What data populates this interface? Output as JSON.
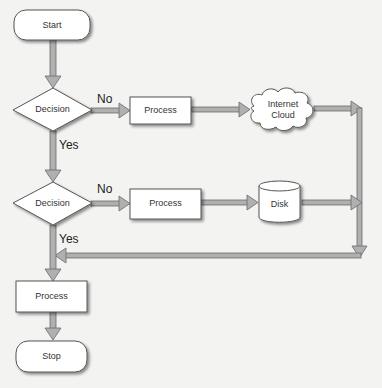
{
  "diagram": {
    "type": "flowchart",
    "colors": {
      "background": "#f3f3f1",
      "node_fill": "#ffffff",
      "node_stroke": "#555555",
      "arrow_fill": "#a8a8a8",
      "arrow_stroke": "#6e6e6e",
      "text": "#333333"
    },
    "nodes": [
      {
        "id": "start",
        "shape": "terminator",
        "label": "Start"
      },
      {
        "id": "decision1",
        "shape": "diamond",
        "label": "Decision"
      },
      {
        "id": "process1",
        "shape": "rectangle",
        "label": "Process"
      },
      {
        "id": "cloud",
        "shape": "cloud",
        "label_line1": "Internet",
        "label_line2": "Cloud"
      },
      {
        "id": "decision2",
        "shape": "diamond",
        "label": "Decision"
      },
      {
        "id": "process2",
        "shape": "rectangle",
        "label": "Process"
      },
      {
        "id": "disk",
        "shape": "cylinder",
        "label": "Disk"
      },
      {
        "id": "process3",
        "shape": "rectangle",
        "label": "Process"
      },
      {
        "id": "stop",
        "shape": "terminator",
        "label": "Stop"
      }
    ],
    "edges": [
      {
        "from": "start",
        "to": "decision1",
        "label": ""
      },
      {
        "from": "decision1",
        "to": "process1",
        "label": "No"
      },
      {
        "from": "process1",
        "to": "cloud",
        "label": ""
      },
      {
        "from": "cloud",
        "to": "merge-right",
        "label": ""
      },
      {
        "from": "decision1",
        "to": "decision2",
        "label": "Yes"
      },
      {
        "from": "decision2",
        "to": "process2",
        "label": "No"
      },
      {
        "from": "process2",
        "to": "disk",
        "label": ""
      },
      {
        "from": "disk",
        "to": "merge-right",
        "label": ""
      },
      {
        "from": "merge-right",
        "to": "main-line",
        "label": ""
      },
      {
        "from": "decision2",
        "to": "process3",
        "label": "Yes"
      },
      {
        "from": "process3",
        "to": "stop",
        "label": ""
      }
    ],
    "edge_labels": {
      "d1_no": "No",
      "d1_yes": "Yes",
      "d2_no": "No",
      "d2_yes": "Yes"
    }
  }
}
